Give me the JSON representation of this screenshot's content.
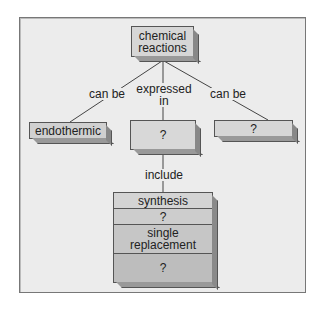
{
  "diagram": {
    "type": "concept-map",
    "root": {
      "label": "chemical reactions"
    },
    "links": {
      "left": "can be",
      "middle": "expressed in",
      "right": "can be",
      "down": "include"
    },
    "nodes": {
      "left": "endothermic",
      "middle": "?",
      "right": "?"
    },
    "stack": {
      "rows": [
        "synthesis",
        "?",
        "single replacement",
        "?"
      ]
    },
    "colors": {
      "background": "#ececec",
      "root_face": "#d6d6d6",
      "node_face": "#d0d0d0",
      "stack_rows": [
        "#d4d4d4",
        "#cdcdcd",
        "#c6c6c6",
        "#bdbdbd"
      ],
      "border": "#555555"
    }
  }
}
